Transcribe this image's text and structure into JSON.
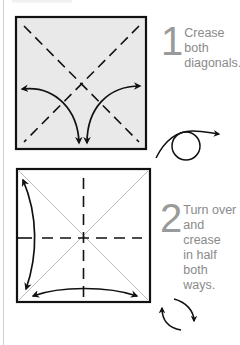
{
  "page": {
    "heading_clipped": true
  },
  "colors": {
    "line": "#111111",
    "paper_fill_step1": "#e9e9e9",
    "paper_fill_step2": "#ffffff",
    "light_crease": "#bdbdbd",
    "text": "#8a8a8a",
    "number": "#9a9a9a"
  },
  "steps": [
    {
      "number": "1",
      "text": "Crease both\ndiagonals.",
      "diagram": {
        "square": {
          "x": 16,
          "y": 17,
          "w": 130,
          "h": 132,
          "fill": "#e9e9e9"
        },
        "creases": [
          "diagonal-valley-dashed",
          "diagonal-valley-dashed"
        ],
        "arrows": [
          "fold-and-unfold-left-to-bottom",
          "fold-and-unfold-right-to-bottom"
        ]
      },
      "symbol": "turn-over"
    },
    {
      "number": "2",
      "text": "Turn over\nand crease\nin half both\nways.",
      "diagram": {
        "square": {
          "x": 17,
          "y": 169,
          "w": 133,
          "h": 133,
          "fill": "#ffffff"
        },
        "creases": [
          "diagonal-existing-light",
          "diagonal-existing-light",
          "vertical-valley-dashed",
          "horizontal-valley-dashed"
        ],
        "arrows": [
          "fold-and-unfold-vertical",
          "fold-and-unfold-horizontal"
        ]
      },
      "symbol": "rotate"
    }
  ]
}
